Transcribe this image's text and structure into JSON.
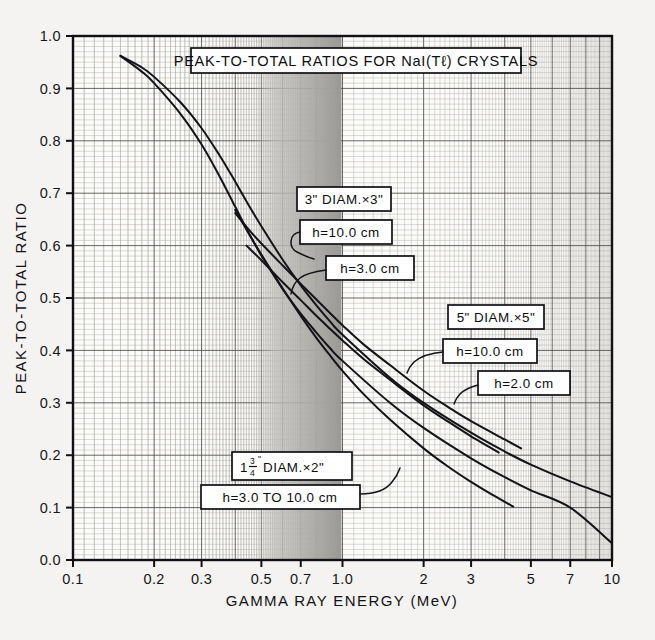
{
  "figure": {
    "background_color": "#f4f3f1",
    "plot_background_color": "#fbfbf9",
    "grid_color": "#8e8d8a",
    "curve_color": "#141418",
    "shaded_band_color": "#b9b7b3"
  },
  "title_box": {
    "text": "PEAK-TO-TOTAL RATIOS FOR NaI(Tℓ) CRYSTALS"
  },
  "axes": {
    "x_title": "GAMMA RAY ENERGY (MeV)",
    "y_title": "PEAK-TO-TOTAL RATIO",
    "x_scale": "log",
    "y_scale": "linear",
    "x_ticks": [
      {
        "value": 0.1,
        "label": "0.1"
      },
      {
        "value": 0.2,
        "label": "0.2"
      },
      {
        "value": 0.3,
        "label": "0.3"
      },
      {
        "value": 0.5,
        "label": "0.5"
      },
      {
        "value": 0.7,
        "label": "0.7"
      },
      {
        "value": 1.0,
        "label": "1.0"
      },
      {
        "value": 2.0,
        "label": "2"
      },
      {
        "value": 3.0,
        "label": "3"
      },
      {
        "value": 5.0,
        "label": "5"
      },
      {
        "value": 7.0,
        "label": "7"
      },
      {
        "value": 10.0,
        "label": "10"
      }
    ],
    "y_ticks": [
      {
        "value": 0.0,
        "label": "0.0"
      },
      {
        "value": 0.1,
        "label": "0.1"
      },
      {
        "value": 0.2,
        "label": "0.2"
      },
      {
        "value": 0.3,
        "label": "0.3"
      },
      {
        "value": 0.4,
        "label": "0.4"
      },
      {
        "value": 0.5,
        "label": "0.5"
      },
      {
        "value": 0.6,
        "label": "0.6"
      },
      {
        "value": 0.7,
        "label": "0.7"
      },
      {
        "value": 0.8,
        "label": "0.8"
      },
      {
        "value": 0.9,
        "label": "0.9"
      },
      {
        "value": 1.0,
        "label": "1.0"
      }
    ]
  },
  "callouts": {
    "crystal_3in": {
      "size_label": "3\" DIAM.×3\"",
      "h10_label": "h=10.0 cm",
      "h3_label": "h=3.0 cm"
    },
    "crystal_5in": {
      "size_label": "5\" DIAM.×5\"",
      "h10_label": "h=10.0 cm",
      "h2_label": "h=2.0 cm"
    },
    "crystal_1p75in": {
      "size_prefix": "1",
      "size_frac_num": "3",
      "size_frac_den": "4",
      "size_frac_mark": "\"",
      "size_suffix": " DIAM.×2\"",
      "size_label_plain": "1 3/4\" DIAM.×2\"",
      "h_label": "h=3.0  TO  10.0 cm"
    }
  },
  "chart_data": {
    "type": "line",
    "title": "PEAK-TO-TOTAL RATIOS FOR NaI(Tℓ) CRYSTALS",
    "xlabel": "GAMMA RAY ENERGY (MeV)",
    "ylabel": "PEAK-TO-TOTAL RATIO",
    "xscale": "log",
    "yscale": "linear",
    "xlim": [
      0.1,
      10.0
    ],
    "ylim": [
      0.0,
      1.0
    ],
    "grid": true,
    "legend": "inline-callout-boxes",
    "annotations": [
      {
        "text": "PEAK-TO-TOTAL RATIOS FOR NaI(Tℓ) CRYSTALS",
        "kind": "title-box"
      },
      {
        "text": "3\" DIAM.×3\"",
        "kind": "series-group-label"
      },
      {
        "text": "h=10.0 cm",
        "kind": "series-label",
        "group": "3\" DIAM.×3\""
      },
      {
        "text": "h=3.0 cm",
        "kind": "series-label",
        "group": "3\" DIAM.×3\""
      },
      {
        "text": "5\" DIAM.×5\"",
        "kind": "series-group-label"
      },
      {
        "text": "h=10.0 cm",
        "kind": "series-label",
        "group": "5\" DIAM.×5\""
      },
      {
        "text": "h=2.0 cm",
        "kind": "series-label",
        "group": "5\" DIAM.×5\""
      },
      {
        "text": "1 3/4\" DIAM.×2\"",
        "kind": "series-group-label"
      },
      {
        "text": "h=3.0  TO  10.0 cm",
        "kind": "series-label",
        "group": "1 3/4\" DIAM.×2\""
      }
    ],
    "shaded_band": {
      "x_from": 0.62,
      "x_to": 1.0,
      "note": "grey gradient band"
    },
    "series": [
      {
        "name": "5\" DIAM.×5\", h=10.0 cm",
        "points": [
          [
            0.15,
            0.962
          ],
          [
            0.18,
            0.94
          ],
          [
            0.2,
            0.922
          ],
          [
            0.25,
            0.874
          ],
          [
            0.3,
            0.824
          ],
          [
            0.35,
            0.772
          ],
          [
            0.4,
            0.722
          ],
          [
            0.45,
            0.676
          ],
          [
            0.5,
            0.637
          ],
          [
            0.6,
            0.573
          ],
          [
            0.7,
            0.524
          ],
          [
            0.8,
            0.486
          ],
          [
            0.9,
            0.455
          ],
          [
            1.0,
            0.43
          ],
          [
            1.5,
            0.348
          ],
          [
            2.0,
            0.3
          ],
          [
            3.0,
            0.243
          ],
          [
            4.0,
            0.207
          ],
          [
            5.0,
            0.182
          ],
          [
            7.0,
            0.15
          ],
          [
            10.0,
            0.12
          ]
        ]
      },
      {
        "name": "5\" DIAM.×5\", h=2.0 cm",
        "points": [
          [
            0.4,
            0.662
          ],
          [
            0.45,
            0.63
          ],
          [
            0.5,
            0.604
          ],
          [
            0.6,
            0.562
          ],
          [
            0.7,
            0.527
          ],
          [
            0.8,
            0.497
          ],
          [
            0.9,
            0.471
          ],
          [
            1.0,
            0.448
          ],
          [
            1.2,
            0.411
          ],
          [
            1.5,
            0.372
          ],
          [
            2.0,
            0.323
          ],
          [
            2.5,
            0.29
          ],
          [
            3.0,
            0.265
          ],
          [
            4.0,
            0.23
          ],
          [
            4.6,
            0.213
          ]
        ]
      },
      {
        "name": "3\" DIAM.×3\", h=10.0 cm",
        "points": [
          [
            0.15,
            0.962
          ],
          [
            0.18,
            0.932
          ],
          [
            0.2,
            0.91
          ],
          [
            0.25,
            0.852
          ],
          [
            0.3,
            0.793
          ],
          [
            0.35,
            0.732
          ],
          [
            0.4,
            0.674
          ],
          [
            0.45,
            0.623
          ],
          [
            0.5,
            0.581
          ],
          [
            0.6,
            0.517
          ],
          [
            0.7,
            0.47
          ],
          [
            0.8,
            0.434
          ],
          [
            0.9,
            0.404
          ],
          [
            1.0,
            0.38
          ],
          [
            1.5,
            0.3
          ],
          [
            2.0,
            0.252
          ],
          [
            3.0,
            0.194
          ],
          [
            4.0,
            0.158
          ],
          [
            5.0,
            0.133
          ],
          [
            7.0,
            0.1
          ],
          [
            10.0,
            0.032
          ]
        ]
      },
      {
        "name": "3\" DIAM.×3\", h=3.0 cm",
        "points": [
          [
            0.44,
            0.6
          ],
          [
            0.5,
            0.572
          ],
          [
            0.6,
            0.53
          ],
          [
            0.7,
            0.496
          ],
          [
            0.8,
            0.466
          ],
          [
            0.9,
            0.441
          ],
          [
            1.0,
            0.419
          ],
          [
            1.2,
            0.383
          ],
          [
            1.5,
            0.344
          ],
          [
            2.0,
            0.295
          ],
          [
            2.5,
            0.262
          ],
          [
            3.0,
            0.236
          ],
          [
            3.5,
            0.216
          ],
          [
            3.8,
            0.205
          ]
        ]
      },
      {
        "name": "1 3/4\" DIAM.×2\", h=3.0 TO 10.0 cm",
        "points": [
          [
            0.4,
            0.668
          ],
          [
            0.45,
            0.622
          ],
          [
            0.5,
            0.583
          ],
          [
            0.6,
            0.518
          ],
          [
            0.7,
            0.466
          ],
          [
            0.8,
            0.424
          ],
          [
            0.9,
            0.39
          ],
          [
            1.0,
            0.361
          ],
          [
            1.2,
            0.316
          ],
          [
            1.5,
            0.268
          ],
          [
            2.0,
            0.213
          ],
          [
            2.5,
            0.176
          ],
          [
            3.0,
            0.149
          ],
          [
            3.5,
            0.128
          ],
          [
            4.0,
            0.111
          ],
          [
            4.3,
            0.102
          ]
        ]
      }
    ]
  }
}
